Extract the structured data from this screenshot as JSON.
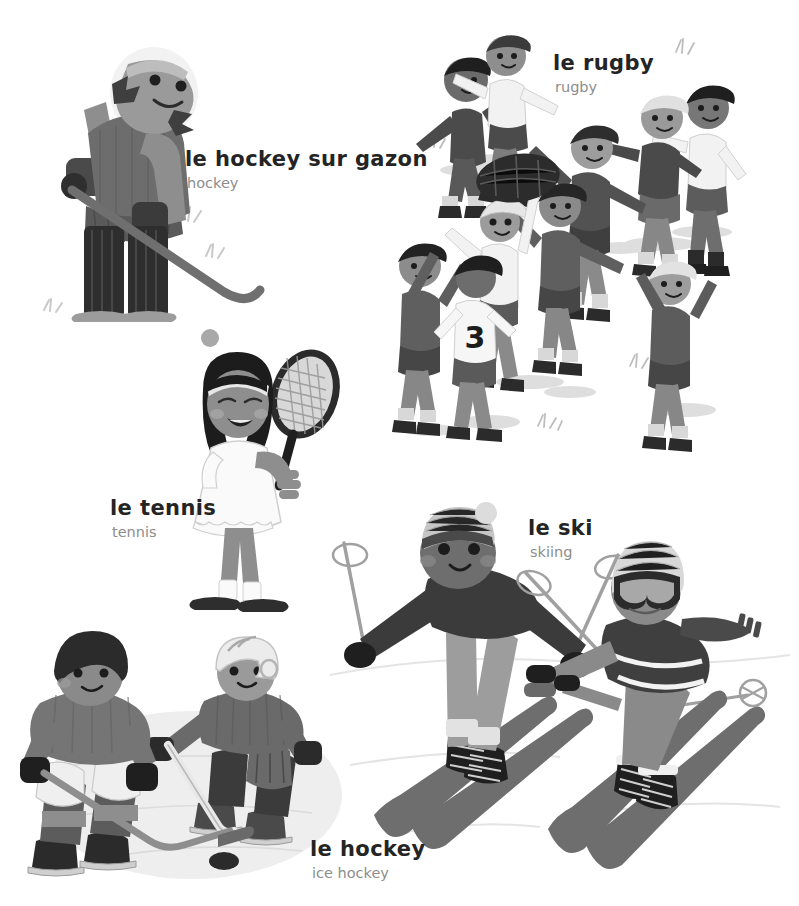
{
  "page": {
    "background_color": "#ffffff",
    "width": 799,
    "height": 906,
    "style": "grayscale children's picture-book illustration, French vocabulary page"
  },
  "palette": {
    "ink": "#242424",
    "translation_gray": "#8d8d8d",
    "dark": "#3a3a3a",
    "mid_dark": "#575757",
    "mid": "#7b7b7b",
    "light_mid": "#a3a3a3",
    "light": "#c9c9c9",
    "pale": "#e2e2e2",
    "very_pale": "#f0f0f0",
    "white": "#ffffff",
    "skin_dark": "#6a6a6a",
    "skin_light": "#b9b9b9"
  },
  "labels": [
    {
      "id": "hockey-sur-gazon",
      "fr": "le hockey sur gazon",
      "en": "hockey",
      "x": 185,
      "y": 148
    },
    {
      "id": "rugby",
      "fr": "le rugby",
      "en": "rugby",
      "x": 553,
      "y": 52
    },
    {
      "id": "tennis",
      "fr": "le tennis",
      "en": "tennis",
      "x": 110,
      "y": 497
    },
    {
      "id": "ski",
      "fr": "le ski",
      "en": "skiing",
      "x": 528,
      "y": 517
    },
    {
      "id": "hockey",
      "fr": "le hockey",
      "en": "ice hockey",
      "x": 310,
      "y": 838
    }
  ],
  "scenes": [
    {
      "id": "field-hockey",
      "name": "field hockey player",
      "description": "goalkeeper-style field hockey player with helmet, pads, gloves and stick, ball on ground",
      "figures": 1,
      "props": [
        "hockey-stick",
        "ball",
        "leg-pads",
        "gloves",
        "helmet"
      ]
    },
    {
      "id": "rugby",
      "name": "rugby lineout",
      "description": "nine children playing rugby, jumping and catching the ball",
      "figures": 9,
      "props": [
        "rugby-ball",
        "grass-tufts"
      ],
      "jersey_number": "3"
    },
    {
      "id": "tennis",
      "name": "tennis player",
      "description": "girl in white tennis dress with headband holding a racket",
      "figures": 1,
      "props": [
        "tennis-racket",
        "headband"
      ]
    },
    {
      "id": "skiing",
      "name": "two skiers",
      "description": "downhill skier in bobble hat with poles and second skier with goggles and scarf",
      "figures": 2,
      "props": [
        "skis",
        "ski-poles",
        "bobble-hat",
        "goggles",
        "scarf"
      ]
    },
    {
      "id": "ice-hockey",
      "name": "ice hockey players",
      "description": "two ice hockey players on ice with sticks and a puck, one wearing a helmet",
      "figures": 2,
      "props": [
        "hockey-sticks",
        "puck",
        "ice-skates",
        "helmet"
      ]
    }
  ]
}
